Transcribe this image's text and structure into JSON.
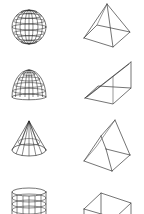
{
  "panel": {
    "title": "3D Objects",
    "stroke_color": "#3a3a3a",
    "background": "#ffffff"
  },
  "shapes": [
    {
      "id": "sphere",
      "label": "Sphere",
      "icon": "sphere-icon",
      "column": 1,
      "row": 1
    },
    {
      "id": "pyramid",
      "label": "Pyramid",
      "icon": "pyramid-icon",
      "column": 2,
      "row": 1
    },
    {
      "id": "dome",
      "label": "Dome",
      "icon": "dome-icon",
      "column": 1,
      "row": 2
    },
    {
      "id": "wedge",
      "label": "Wedge",
      "icon": "wedge-icon",
      "column": 2,
      "row": 2
    },
    {
      "id": "cone",
      "label": "Cone",
      "icon": "cone-icon",
      "column": 1,
      "row": 3
    },
    {
      "id": "prism",
      "label": "Prism",
      "icon": "prism-icon",
      "column": 2,
      "row": 3
    },
    {
      "id": "cylinder",
      "label": "Cylinder",
      "icon": "cylinder-icon",
      "column": 1,
      "row": 4
    },
    {
      "id": "box",
      "label": "Box",
      "icon": "box-icon",
      "column": 2,
      "row": 4
    }
  ]
}
